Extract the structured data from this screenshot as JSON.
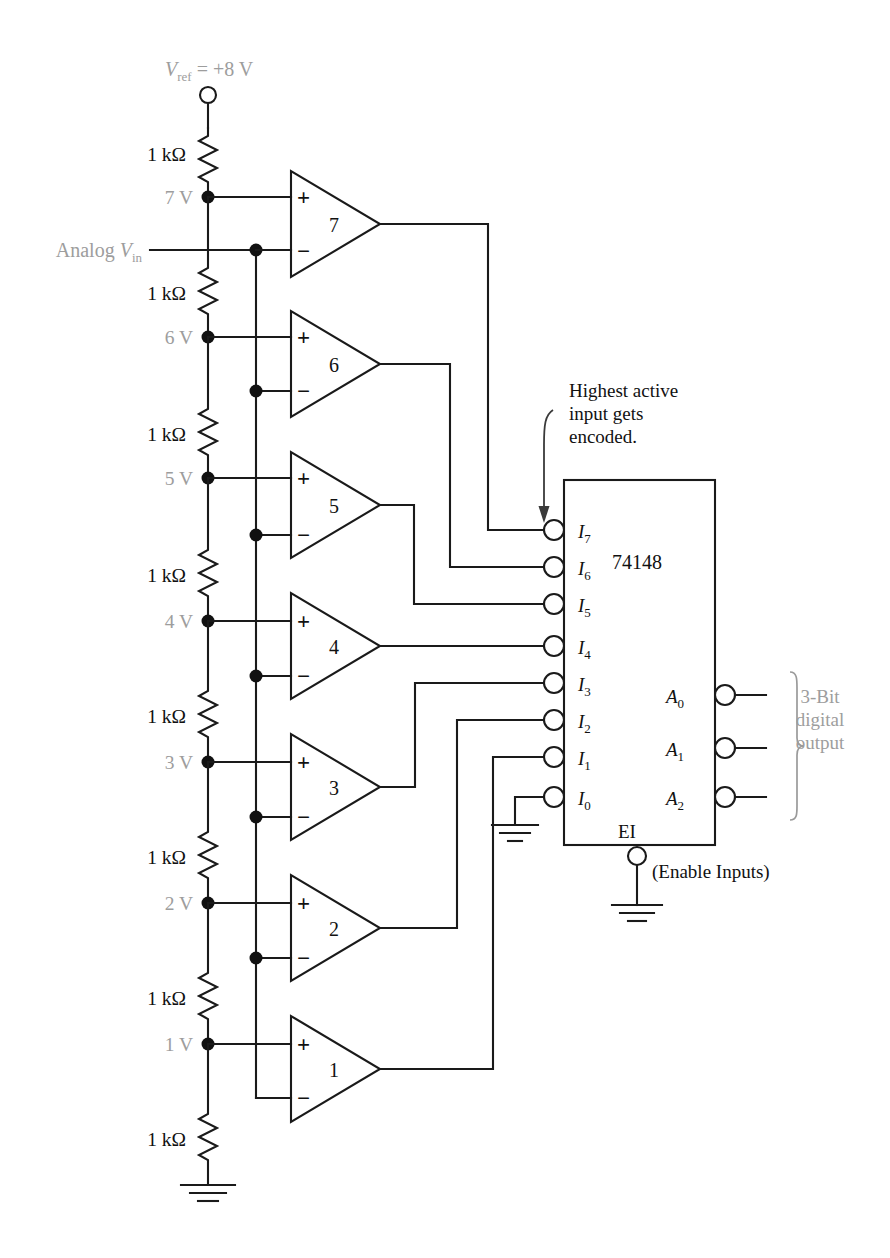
{
  "diagram": {
    "reference": {
      "label_v": "V",
      "label_sub": "ref",
      "label_eq": "= +8 V",
      "full": "Vref = +8 V"
    },
    "analog_input": {
      "label": "Analog V",
      "sub": "in"
    },
    "resistors": [
      {
        "id": "r8",
        "value": "1 kΩ"
      },
      {
        "id": "r7",
        "value": "1 kΩ"
      },
      {
        "id": "r6",
        "value": "1 kΩ"
      },
      {
        "id": "r5",
        "value": "1 kΩ"
      },
      {
        "id": "r4",
        "value": "1 kΩ"
      },
      {
        "id": "r3",
        "value": "1 kΩ"
      },
      {
        "id": "r2",
        "value": "1 kΩ"
      },
      {
        "id": "r1",
        "value": "1 kΩ"
      }
    ],
    "tap_voltages": [
      {
        "id": "tap7",
        "label": "7 V"
      },
      {
        "id": "tap6",
        "label": "6 V"
      },
      {
        "id": "tap5",
        "label": "5 V"
      },
      {
        "id": "tap4",
        "label": "4 V"
      },
      {
        "id": "tap3",
        "label": "3 V"
      },
      {
        "id": "tap2",
        "label": "2 V"
      },
      {
        "id": "tap1",
        "label": "1 V"
      }
    ],
    "comparators": [
      {
        "id": "cmp7",
        "label": "7",
        "plus": "+",
        "minus": "−"
      },
      {
        "id": "cmp6",
        "label": "6",
        "plus": "+",
        "minus": "−"
      },
      {
        "id": "cmp5",
        "label": "5",
        "plus": "+",
        "minus": "−"
      },
      {
        "id": "cmp4",
        "label": "4",
        "plus": "+",
        "minus": "−"
      },
      {
        "id": "cmp3",
        "label": "3",
        "plus": "+",
        "minus": "−"
      },
      {
        "id": "cmp2",
        "label": "2",
        "plus": "+",
        "minus": "−"
      },
      {
        "id": "cmp1",
        "label": "1",
        "plus": "+",
        "minus": "−"
      }
    ],
    "chip": {
      "part_number": "74148",
      "inputs": [
        {
          "id": "i7",
          "base": "I",
          "sub": "7"
        },
        {
          "id": "i6",
          "base": "I",
          "sub": "6"
        },
        {
          "id": "i5",
          "base": "I",
          "sub": "5"
        },
        {
          "id": "i4",
          "base": "I",
          "sub": "4"
        },
        {
          "id": "i3",
          "base": "I",
          "sub": "3"
        },
        {
          "id": "i2",
          "base": "I",
          "sub": "2"
        },
        {
          "id": "i1",
          "base": "I",
          "sub": "1"
        },
        {
          "id": "i0",
          "base": "I",
          "sub": "0"
        }
      ],
      "outputs": [
        {
          "id": "a0",
          "base": "A",
          "sub": "0"
        },
        {
          "id": "a1",
          "base": "A",
          "sub": "1"
        },
        {
          "id": "a2",
          "base": "A",
          "sub": "2"
        }
      ],
      "enable": {
        "label": "EI",
        "caption": "(Enable Inputs)"
      }
    },
    "annotations": [
      {
        "id": "note-encoded",
        "line1": "Highest active",
        "line2": "input gets",
        "line3": "encoded."
      },
      {
        "id": "note-output",
        "line1": "3-Bit",
        "line2": "digital",
        "line3": "output"
      }
    ],
    "colors": {
      "wire": "#1a1a1a",
      "gray_text": "#9d9d9d",
      "black_text": "#111111",
      "background": "#ffffff"
    }
  }
}
